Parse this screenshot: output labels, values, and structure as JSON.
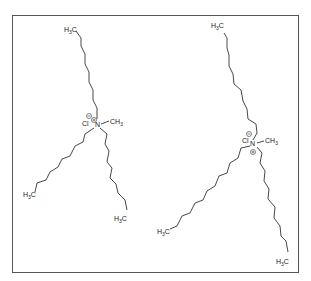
{
  "figure": {
    "frame_color": "#555555",
    "bond_color": "#333333"
  },
  "molecules": [
    {
      "name": "methyltrioctylammonium chloride",
      "atoms": {
        "nitrogen": "N",
        "methyl": "CH",
        "methyl_sub": "3",
        "anion": "Cl",
        "terminal_a": "H",
        "terminal_a_sub": "3",
        "terminal_a_c": "C",
        "terminal_b": "H",
        "terminal_b_sub": "3",
        "terminal_b_c": "C",
        "terminal_c": "H",
        "terminal_c_sub": "3",
        "terminal_c_c": "C"
      },
      "charges": {
        "cation": "+",
        "anion": "−"
      }
    },
    {
      "name": "methyltridecylammonium chloride",
      "atoms": {
        "nitrogen": "N",
        "methyl": "CH",
        "methyl_sub": "3",
        "anion": "Cl",
        "terminal_a": "H",
        "terminal_a_sub": "3",
        "terminal_a_c": "C",
        "terminal_b": "H",
        "terminal_b_sub": "3",
        "terminal_b_c": "C",
        "terminal_c": "H",
        "terminal_c_sub": "3",
        "terminal_c_c": "C"
      },
      "charges": {
        "cation": "+",
        "anion": "−"
      }
    }
  ]
}
